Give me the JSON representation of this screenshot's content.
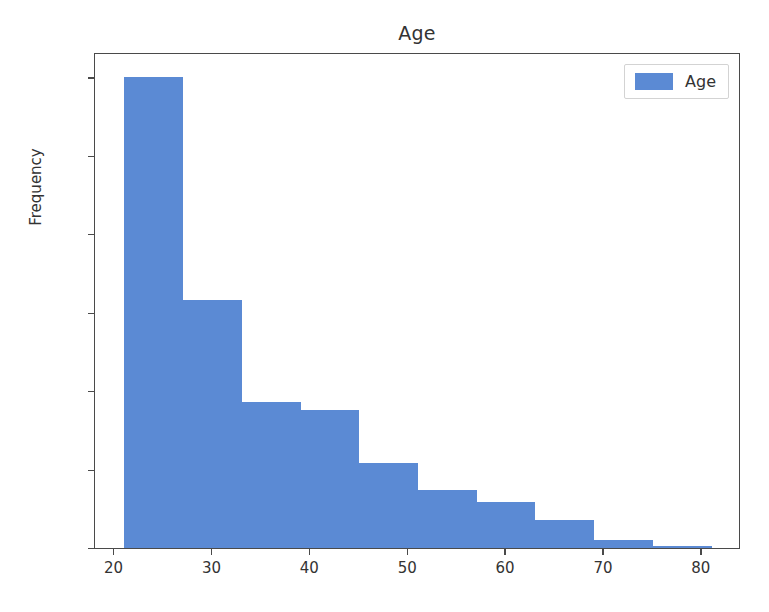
{
  "chart_data": {
    "type": "bar",
    "title": "Age",
    "subtitle": "",
    "xlabel": "",
    "ylabel": "Frequency",
    "grid": false,
    "legend_position": "upper right",
    "legend": [
      "Age"
    ],
    "bar_color": "#5b8ad4",
    "xlim": [
      18.0,
      84.0
    ],
    "ylim": [
      0,
      316
    ],
    "xticks": [
      "20",
      "30",
      "40",
      "50",
      "60",
      "70",
      "80"
    ],
    "xtick_values": [
      20,
      30,
      40,
      50,
      60,
      70,
      80
    ],
    "yticks": [
      "0",
      "50",
      "100",
      "150",
      "200",
      "250",
      "300"
    ],
    "ytick_values": [
      0,
      50,
      100,
      150,
      200,
      250,
      300
    ],
    "bin_edges": [
      21,
      27,
      33,
      39,
      45,
      51,
      57,
      63,
      69,
      75,
      81
    ],
    "categories": [
      "21-27",
      "27-33",
      "33-39",
      "39-45",
      "45-51",
      "51-57",
      "57-63",
      "63-69",
      "69-75",
      "75-81"
    ],
    "values": [
      300,
      158,
      93,
      88,
      54,
      37,
      29,
      18,
      5,
      1
    ],
    "series": [
      {
        "name": "Age",
        "values": [
          300,
          158,
          93,
          88,
          54,
          37,
          29,
          18,
          5,
          1
        ]
      }
    ]
  }
}
